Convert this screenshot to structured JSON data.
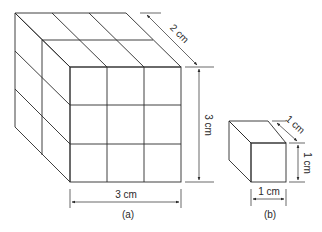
{
  "figure_a": {
    "caption": "(a)",
    "labels": {
      "depth": "2 cm",
      "height": "3 cm",
      "width": "3 cm"
    },
    "grid": {
      "cols": 3,
      "rows": 3,
      "depth_layers": 2
    }
  },
  "figure_b": {
    "caption": "(b)",
    "labels": {
      "depth": "1 cm",
      "height": "1 cm",
      "width": "1 cm"
    }
  },
  "colors": {
    "line": "#2a2a2a",
    "background": "#ffffff"
  }
}
